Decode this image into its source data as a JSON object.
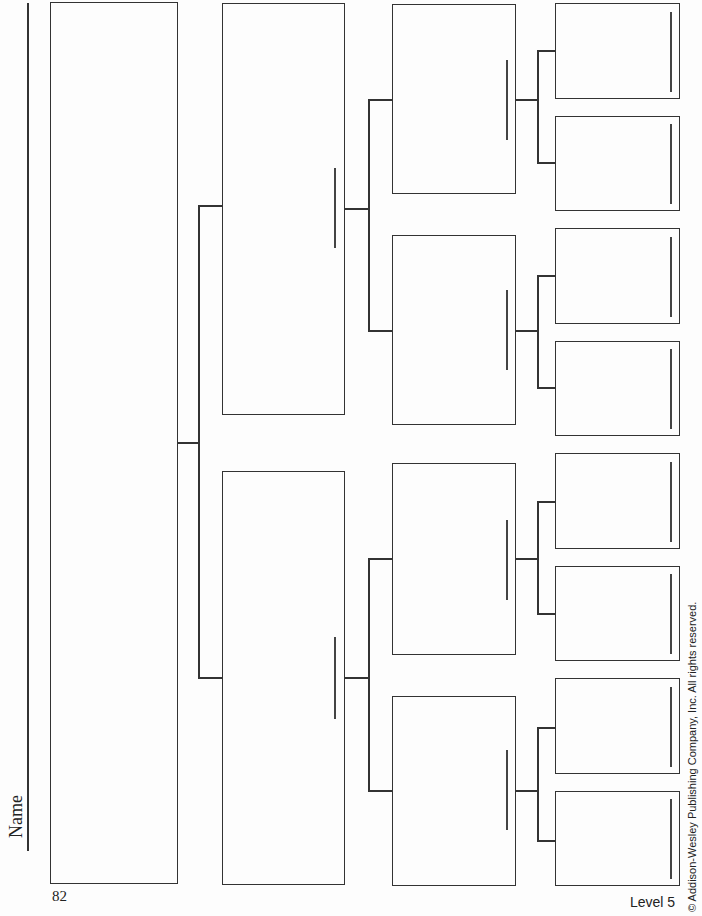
{
  "header": {
    "name_label": "Name"
  },
  "footer": {
    "page_number": "82",
    "level": "Level 5",
    "copyright": "© Addison-Wesley Publishing Company, Inc. All rights reserved."
  },
  "diagram": {
    "type": "tree-diagram",
    "levels": 4,
    "level_box_counts": [
      1,
      2,
      4,
      8
    ],
    "boxes_blank": true
  }
}
